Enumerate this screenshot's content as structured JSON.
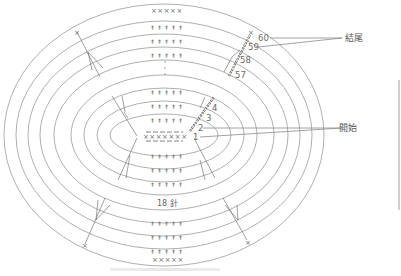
{
  "diagram": {
    "foundation_chain_count_label": "18 針",
    "center_stitches": "×××××××",
    "top_end_stitches": "×××××",
    "bottom_end_stitches": "×××××",
    "round_numbers_start": [
      "1",
      "2",
      "3",
      "4"
    ],
    "round_numbers_end": [
      "57",
      "58",
      "59",
      "60"
    ],
    "callouts": {
      "end": "結尾",
      "start": "開始"
    },
    "symbols": {
      "single_crochet": "×",
      "double_crochet": "↟",
      "ellipsis": "⋮"
    },
    "colors": {
      "line": "#9a9a9a",
      "text": "#6a6a6a",
      "background": "#ffffff"
    }
  }
}
